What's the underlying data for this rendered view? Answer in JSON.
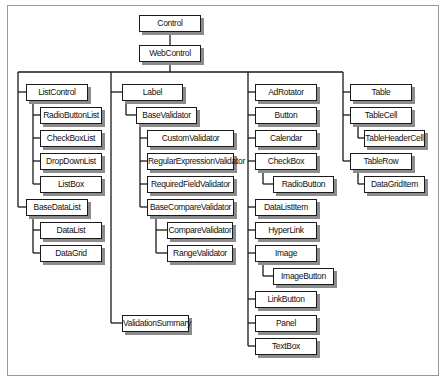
{
  "diagram": {
    "title": "",
    "type": "class-hierarchy",
    "root": "Control",
    "nodes": [
      {
        "id": "control",
        "label": "Control",
        "parent": null,
        "x": 139,
        "y": 15,
        "w": 62
      },
      {
        "id": "webcontrol",
        "label": "WebControl",
        "parent": "control",
        "x": 139,
        "y": 45,
        "w": 62
      },
      {
        "id": "listcontrol",
        "label": "ListControl",
        "parent": "webcontrol",
        "x": 26,
        "y": 84,
        "w": 62
      },
      {
        "id": "radiobuttonlist",
        "label": "RadioButtonList",
        "parent": "listcontrol",
        "x": 40,
        "y": 107,
        "w": 62
      },
      {
        "id": "checkboxlist",
        "label": "CheckBoxList",
        "parent": "listcontrol",
        "x": 40,
        "y": 130,
        "w": 62
      },
      {
        "id": "dropdownlist",
        "label": "DropDownList",
        "parent": "listcontrol",
        "x": 40,
        "y": 153,
        "w": 62
      },
      {
        "id": "listbox",
        "label": "ListBox",
        "parent": "listcontrol",
        "x": 40,
        "y": 176,
        "w": 62
      },
      {
        "id": "basedatalist",
        "label": "BaseDataList",
        "parent": "webcontrol",
        "x": 26,
        "y": 199,
        "w": 62
      },
      {
        "id": "datalist",
        "label": "DataList",
        "parent": "basedatalist",
        "x": 40,
        "y": 222,
        "w": 62
      },
      {
        "id": "datagrid",
        "label": "DataGrid",
        "parent": "basedatalist",
        "x": 40,
        "y": 245,
        "w": 62
      },
      {
        "id": "label",
        "label": "Label",
        "parent": "webcontrol",
        "x": 122,
        "y": 84,
        "w": 61
      },
      {
        "id": "basevalidator",
        "label": "BaseValidator",
        "parent": "label",
        "x": 136,
        "y": 107,
        "w": 61
      },
      {
        "id": "customvalidator",
        "label": "CustomValidator",
        "parent": "basevalidator",
        "x": 147,
        "y": 130,
        "w": 87
      },
      {
        "id": "regularexpressionvalidator",
        "label": "RegularExpressionValidator",
        "parent": "basevalidator",
        "x": 147,
        "y": 153,
        "w": 87
      },
      {
        "id": "requiredfieldvalidator",
        "label": "RequiredFieldValidator",
        "parent": "basevalidator",
        "x": 147,
        "y": 176,
        "w": 87
      },
      {
        "id": "basecomparevalidator",
        "label": "BaseCompareValidator",
        "parent": "basevalidator",
        "x": 147,
        "y": 199,
        "w": 87
      },
      {
        "id": "comparevalidator",
        "label": "CompareValidator",
        "parent": "basecomparevalidator",
        "x": 167,
        "y": 222,
        "w": 66
      },
      {
        "id": "rangevalidator",
        "label": "RangeValidator",
        "parent": "basecomparevalidator",
        "x": 167,
        "y": 245,
        "w": 66
      },
      {
        "id": "validationsummary",
        "label": "ValidationSummary",
        "parent": "webcontrol",
        "x": 122,
        "y": 315,
        "w": 67
      },
      {
        "id": "adrotator",
        "label": "AdRotator",
        "parent": "webcontrol",
        "x": 255,
        "y": 84,
        "w": 62
      },
      {
        "id": "button",
        "label": "Button",
        "parent": "webcontrol",
        "x": 255,
        "y": 107,
        "w": 62
      },
      {
        "id": "calendar",
        "label": "Calendar",
        "parent": "webcontrol",
        "x": 255,
        "y": 130,
        "w": 62
      },
      {
        "id": "checkbox",
        "label": "CheckBox",
        "parent": "webcontrol",
        "x": 255,
        "y": 153,
        "w": 62
      },
      {
        "id": "radiobutton",
        "label": "RadioButton",
        "parent": "checkbox",
        "x": 273,
        "y": 176,
        "w": 61
      },
      {
        "id": "datalistitem",
        "label": "DataListItem",
        "parent": "webcontrol",
        "x": 255,
        "y": 199,
        "w": 62
      },
      {
        "id": "hyperlink",
        "label": "HyperLink",
        "parent": "webcontrol",
        "x": 255,
        "y": 222,
        "w": 62
      },
      {
        "id": "image",
        "label": "Image",
        "parent": "webcontrol",
        "x": 255,
        "y": 245,
        "w": 62
      },
      {
        "id": "imagebutton",
        "label": "ImageButton",
        "parent": "image",
        "x": 273,
        "y": 268,
        "w": 61
      },
      {
        "id": "linkbutton",
        "label": "LinkButton",
        "parent": "webcontrol",
        "x": 255,
        "y": 291,
        "w": 62
      },
      {
        "id": "panel",
        "label": "Panel",
        "parent": "webcontrol",
        "x": 255,
        "y": 315,
        "w": 62
      },
      {
        "id": "textbox",
        "label": "TextBox",
        "parent": "webcontrol",
        "x": 255,
        "y": 338,
        "w": 62
      },
      {
        "id": "table",
        "label": "Table",
        "parent": "webcontrol",
        "x": 350,
        "y": 84,
        "w": 62
      },
      {
        "id": "tablecell",
        "label": "TableCell",
        "parent": "webcontrol",
        "x": 350,
        "y": 107,
        "w": 62
      },
      {
        "id": "tableheadercell",
        "label": "TableHeaderCell",
        "parent": "tablecell",
        "x": 364,
        "y": 130,
        "w": 61
      },
      {
        "id": "tablerow",
        "label": "TableRow",
        "parent": "webcontrol",
        "x": 350,
        "y": 153,
        "w": 62
      },
      {
        "id": "datagriditem",
        "label": "DataGridItem",
        "parent": "tablerow",
        "x": 364,
        "y": 176,
        "w": 61
      }
    ],
    "connectors": [
      {
        "type": "v",
        "x": 170,
        "y1": 32,
        "y2": 45
      },
      {
        "type": "v",
        "x": 170,
        "y1": 62,
        "y2": 72
      },
      {
        "type": "h",
        "y": 72,
        "x1": 18,
        "x2": 343
      },
      {
        "type": "v",
        "x": 18,
        "y1": 72,
        "y2": 207
      },
      {
        "type": "h",
        "y": 92,
        "x1": 18,
        "x2": 26
      },
      {
        "type": "h",
        "y": 207,
        "x1": 18,
        "x2": 26
      },
      {
        "type": "v",
        "x": 33,
        "y1": 101,
        "y2": 184
      },
      {
        "type": "h",
        "y": 115,
        "x1": 33,
        "x2": 40
      },
      {
        "type": "h",
        "y": 138,
        "x1": 33,
        "x2": 40
      },
      {
        "type": "h",
        "y": 161,
        "x1": 33,
        "x2": 40
      },
      {
        "type": "h",
        "y": 184,
        "x1": 33,
        "x2": 40
      },
      {
        "type": "v",
        "x": 33,
        "y1": 216,
        "y2": 253
      },
      {
        "type": "h",
        "y": 230,
        "x1": 33,
        "x2": 40
      },
      {
        "type": "h",
        "y": 253,
        "x1": 33,
        "x2": 40
      },
      {
        "type": "v",
        "x": 111,
        "y1": 72,
        "y2": 323
      },
      {
        "type": "h",
        "y": 92,
        "x1": 111,
        "x2": 122
      },
      {
        "type": "h",
        "y": 323,
        "x1": 111,
        "x2": 122
      },
      {
        "type": "v",
        "x": 126,
        "y1": 101,
        "y2": 115
      },
      {
        "type": "h",
        "y": 115,
        "x1": 126,
        "x2": 136
      },
      {
        "type": "v",
        "x": 140,
        "y1": 124,
        "y2": 207
      },
      {
        "type": "h",
        "y": 138,
        "x1": 140,
        "x2": 147
      },
      {
        "type": "h",
        "y": 161,
        "x1": 140,
        "x2": 147
      },
      {
        "type": "h",
        "y": 184,
        "x1": 140,
        "x2": 147
      },
      {
        "type": "h",
        "y": 207,
        "x1": 140,
        "x2": 147
      },
      {
        "type": "v",
        "x": 156,
        "y1": 216,
        "y2": 253
      },
      {
        "type": "h",
        "y": 230,
        "x1": 156,
        "x2": 167
      },
      {
        "type": "h",
        "y": 253,
        "x1": 156,
        "x2": 167
      },
      {
        "type": "v",
        "x": 248,
        "y1": 72,
        "y2": 346
      },
      {
        "type": "h",
        "y": 92,
        "x1": 248,
        "x2": 255
      },
      {
        "type": "h",
        "y": 115,
        "x1": 248,
        "x2": 255
      },
      {
        "type": "h",
        "y": 138,
        "x1": 248,
        "x2": 255
      },
      {
        "type": "h",
        "y": 161,
        "x1": 248,
        "x2": 255
      },
      {
        "type": "h",
        "y": 207,
        "x1": 248,
        "x2": 255
      },
      {
        "type": "h",
        "y": 230,
        "x1": 248,
        "x2": 255
      },
      {
        "type": "h",
        "y": 253,
        "x1": 248,
        "x2": 255
      },
      {
        "type": "h",
        "y": 299,
        "x1": 248,
        "x2": 255
      },
      {
        "type": "h",
        "y": 323,
        "x1": 248,
        "x2": 255
      },
      {
        "type": "h",
        "y": 346,
        "x1": 248,
        "x2": 255
      },
      {
        "type": "v",
        "x": 263,
        "y1": 170,
        "y2": 184
      },
      {
        "type": "h",
        "y": 184,
        "x1": 263,
        "x2": 273
      },
      {
        "type": "v",
        "x": 263,
        "y1": 262,
        "y2": 276
      },
      {
        "type": "h",
        "y": 276,
        "x1": 263,
        "x2": 273
      },
      {
        "type": "v",
        "x": 343,
        "y1": 72,
        "y2": 161
      },
      {
        "type": "h",
        "y": 92,
        "x1": 343,
        "x2": 350
      },
      {
        "type": "h",
        "y": 115,
        "x1": 343,
        "x2": 350
      },
      {
        "type": "h",
        "y": 161,
        "x1": 343,
        "x2": 350
      },
      {
        "type": "v",
        "x": 358,
        "y1": 124,
        "y2": 138
      },
      {
        "type": "h",
        "y": 138,
        "x1": 358,
        "x2": 364
      },
      {
        "type": "v",
        "x": 358,
        "y1": 170,
        "y2": 184
      },
      {
        "type": "h",
        "y": 184,
        "x1": 358,
        "x2": 364
      }
    ]
  },
  "colors": {
    "line": "#1a1a1a",
    "box_border": "#1a1a1a",
    "box_fill": "#ffffff",
    "shadow": "#8c8c8c",
    "frame": "#9a9a9a"
  }
}
